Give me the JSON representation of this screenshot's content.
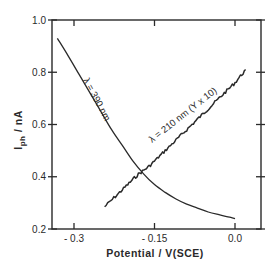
{
  "chart_data": {
    "type": "line",
    "title": "",
    "xlabel": "Potential / V(SCE)",
    "ylabel": "I_ph / nA",
    "ylabel_main": "I",
    "ylabel_sub": "ph",
    "ylabel_unit": " / nA",
    "xlim": [
      -0.34,
      0.05
    ],
    "ylim": [
      0.2,
      1.0
    ],
    "grid": false,
    "legend_position": "inline annotations",
    "x_ticks": [
      {
        "value": -0.3,
        "label": "- 0.3"
      },
      {
        "value": -0.15,
        "label": "- 0.15"
      },
      {
        "value": 0.0,
        "label": "0.0"
      }
    ],
    "y_ticks": [
      {
        "value": 0.2,
        "label": "0.2"
      },
      {
        "value": 0.4,
        "label": "0.4"
      },
      {
        "value": 0.6,
        "label": "0.6"
      },
      {
        "value": 0.8,
        "label": "0.8"
      },
      {
        "value": 1.0,
        "label": "1.0"
      }
    ],
    "series": [
      {
        "name": "λ = 390 nm",
        "label": "λ = 390 nm",
        "noisy": false,
        "x": [
          -0.331,
          -0.31,
          -0.29,
          -0.27,
          -0.25,
          -0.23,
          -0.21,
          -0.19,
          -0.17,
          -0.15,
          -0.13,
          -0.11,
          -0.09,
          -0.07,
          -0.05,
          -0.03,
          -0.01,
          0.0
        ],
        "values": [
          0.93,
          0.86,
          0.79,
          0.72,
          0.65,
          0.58,
          0.52,
          0.46,
          0.41,
          0.37,
          0.34,
          0.315,
          0.295,
          0.28,
          0.265,
          0.255,
          0.245,
          0.24
        ]
      },
      {
        "name": "λ = 210 nm (Y x 10)",
        "label": "λ = 210 nm  (Y x 10)",
        "noisy": true,
        "x": [
          -0.243,
          -0.22,
          -0.2,
          -0.18,
          -0.16,
          -0.14,
          -0.12,
          -0.1,
          -0.08,
          -0.06,
          -0.04,
          -0.02,
          0.0,
          0.02
        ],
        "values": [
          0.285,
          0.33,
          0.37,
          0.41,
          0.44,
          0.48,
          0.52,
          0.56,
          0.6,
          0.64,
          0.68,
          0.72,
          0.76,
          0.81
        ]
      }
    ]
  }
}
